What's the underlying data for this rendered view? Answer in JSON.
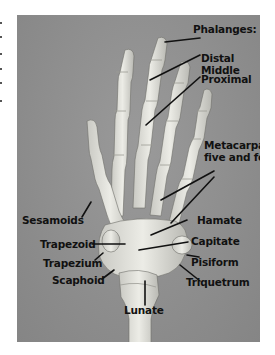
{
  "figure": {
    "header_label": "Phalanges:",
    "phalanges": [
      {
        "id": "distal",
        "label": "Distal"
      },
      {
        "id": "middle",
        "label": "Middle"
      },
      {
        "id": "proximal",
        "label": "Proximal"
      }
    ],
    "metacarpals": {
      "line1": "Metacarpals",
      "line2": "five and four"
    },
    "carpals": [
      {
        "id": "hamate",
        "label": "Hamate"
      },
      {
        "id": "capitate",
        "label": "Capitate"
      },
      {
        "id": "pisiform",
        "label": "Pisiform"
      },
      {
        "id": "triquetrum",
        "label": "Triquetrum"
      },
      {
        "id": "trapezoid",
        "label": "Trapezoid"
      },
      {
        "id": "trapezium",
        "label": "Trapezium"
      },
      {
        "id": "scaphoid",
        "label": "Scaphoid"
      },
      {
        "id": "lunate",
        "label": "Lunate"
      }
    ],
    "other": [
      {
        "id": "sesamoids",
        "label": "Sesamoids"
      }
    ],
    "colors": {
      "background": "#8f8f8f",
      "bone": "#e2e2dc",
      "bone_shadow": "#b8b8b2",
      "label_text": "#111111",
      "leader_line": "#111111",
      "page": "#ffffff"
    }
  }
}
